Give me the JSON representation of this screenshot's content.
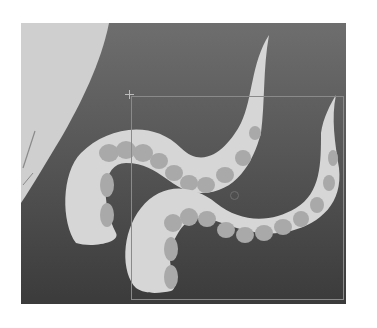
{
  "canvas": {
    "background_gradient": [
      "#6e6e6e",
      "#3d3d3d"
    ],
    "colors": {
      "tentacle": "#d6d6d6",
      "sucker": "#a9a9a9",
      "backdrop_shape": "#cfcfcf",
      "selection_border": "#8a8a8a"
    },
    "layers": [
      {
        "name": "backdrop-shape",
        "kind": "shape"
      },
      {
        "name": "tentacle-upper",
        "kind": "shape"
      },
      {
        "name": "tentacle-lower",
        "kind": "shape"
      }
    ],
    "selection": {
      "left": 110,
      "top": 73,
      "width": 213,
      "height": 204,
      "anchor": {
        "x": 108,
        "y": 71
      },
      "pivot": {
        "x": 213,
        "y": 172
      }
    }
  }
}
